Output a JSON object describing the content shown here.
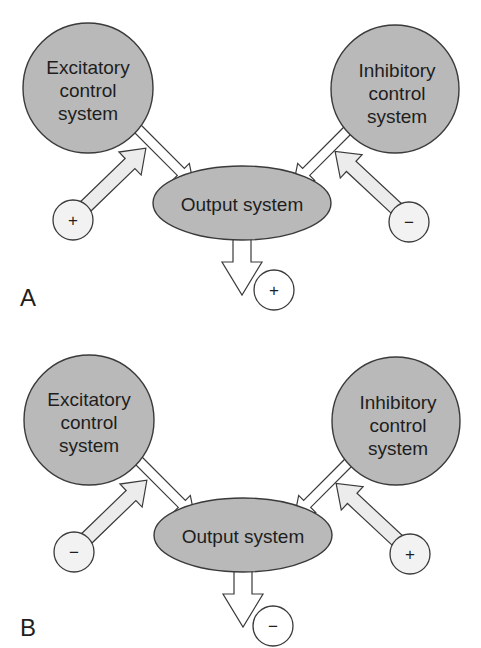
{
  "figure": {
    "panels": [
      {
        "id": "A",
        "label": "A",
        "excitatory": {
          "line1": "Excitatory",
          "line2": "control",
          "line3": "system",
          "input_sign": "+"
        },
        "inhibitory": {
          "line1": "Inhibitory",
          "line2": "control",
          "line3": "system",
          "input_sign": "−"
        },
        "output": {
          "label": "Output system",
          "result_sign": "+"
        }
      },
      {
        "id": "B",
        "label": "B",
        "excitatory": {
          "line1": "Excitatory",
          "line2": "control",
          "line3": "system",
          "input_sign": "−"
        },
        "inhibitory": {
          "line1": "Inhibitory",
          "line2": "control",
          "line3": "system",
          "input_sign": "+"
        },
        "output": {
          "label": "Output system",
          "result_sign": "−"
        }
      }
    ],
    "colors": {
      "node_fill": "#b9b9b9",
      "stroke": "#3a3a3a",
      "input_arrow_fill": "#ececec"
    }
  }
}
